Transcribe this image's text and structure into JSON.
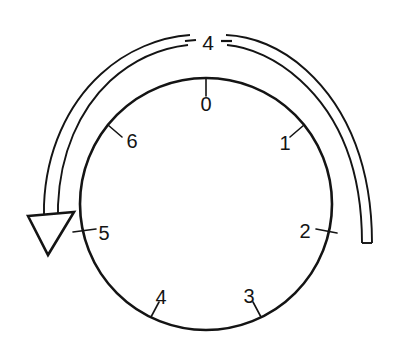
{
  "figure": {
    "background_color": "#ffffff",
    "ink_color": "#141414",
    "width": 401,
    "height": 349
  },
  "dial": {
    "name": "numbered-dial",
    "center_x": 206,
    "center_y": 204,
    "radius": 126,
    "positions": [
      {
        "label": "0",
        "angle_deg": 0,
        "label_x": 206,
        "label_y": 104,
        "tick_outer_r": 126,
        "tick_inner_r": 108
      },
      {
        "label": "1",
        "angle_deg": 51,
        "label_x": 285,
        "label_y": 143,
        "tick_outer_r": 126,
        "tick_inner_r": 108
      },
      {
        "label": "2",
        "angle_deg": 103,
        "label_x": 305,
        "label_y": 231,
        "tick_outer_r": 134,
        "tick_inner_r": 108
      },
      {
        "label": "3",
        "angle_deg": 154,
        "label_x": 249,
        "label_y": 296,
        "tick_outer_r": 126,
        "tick_inner_r": 108
      },
      {
        "label": "4",
        "angle_deg": 206,
        "label_x": 161,
        "label_y": 297,
        "tick_outer_r": 126,
        "tick_inner_r": 108
      },
      {
        "label": "5",
        "angle_deg": 257,
        "label_x": 104,
        "label_y": 233,
        "tick_outer_r": 134,
        "tick_inner_r": 108
      },
      {
        "label": "6",
        "angle_deg": 308,
        "label_x": 132,
        "label_y": 141,
        "tick_outer_r": 126,
        "tick_inner_r": 108
      }
    ]
  },
  "rotation_arrow": {
    "name": "counter-clockwise-rotation-arrow",
    "direction": "counter-clockwise",
    "band_radius_outer": 167,
    "band_radius_inner": 157,
    "arrowhead_tip_x": 44,
    "arrowhead_tip_y": 244,
    "tail_x": 365,
    "tail_y": 243
  },
  "arc_label": {
    "name": "arc-marker-label",
    "text": "4",
    "x": 208,
    "y": 42,
    "left_dash": {
      "x1": 185,
      "y1": 41,
      "x2": 196,
      "y2": 40
    },
    "right_dash": {
      "x1": 221,
      "y1": 41,
      "x2": 232,
      "y2": 41
    }
  }
}
